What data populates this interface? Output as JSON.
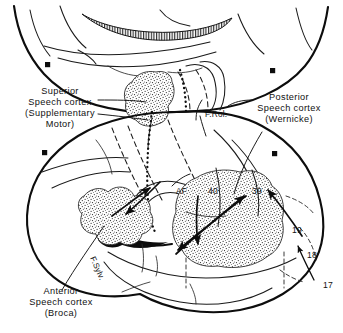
{
  "figure": {
    "background_color": "#ffffff",
    "ink_color": "#0d0d0d",
    "views": {
      "upper": "superior / medial view of hemispheres",
      "lower": "left lateral view of cerebral hemisphere"
    }
  },
  "labels": {
    "superior_speech": {
      "line1": "Superior",
      "line2": "Speech cortex",
      "line3": "(Supplementary",
      "line4": "Motor)"
    },
    "posterior_speech": {
      "line1": "Posterior",
      "line2": "Speech cortex",
      "line3": "(Wernicke)"
    },
    "anterior_speech": {
      "line1": "Anterior",
      "line2": "Speech cortex",
      "line3": "(Broca)"
    },
    "fissures": {
      "rolandic": "F.Rol.",
      "sylvian": "F.Sylv."
    },
    "tract": {
      "arcuate_fasciculus": "AF"
    },
    "brodmann_areas": {
      "supramarginal": "40",
      "angular": "39",
      "visual_association_outer": "19",
      "visual_association_inner": "18",
      "primary_visual": "17"
    }
  }
}
